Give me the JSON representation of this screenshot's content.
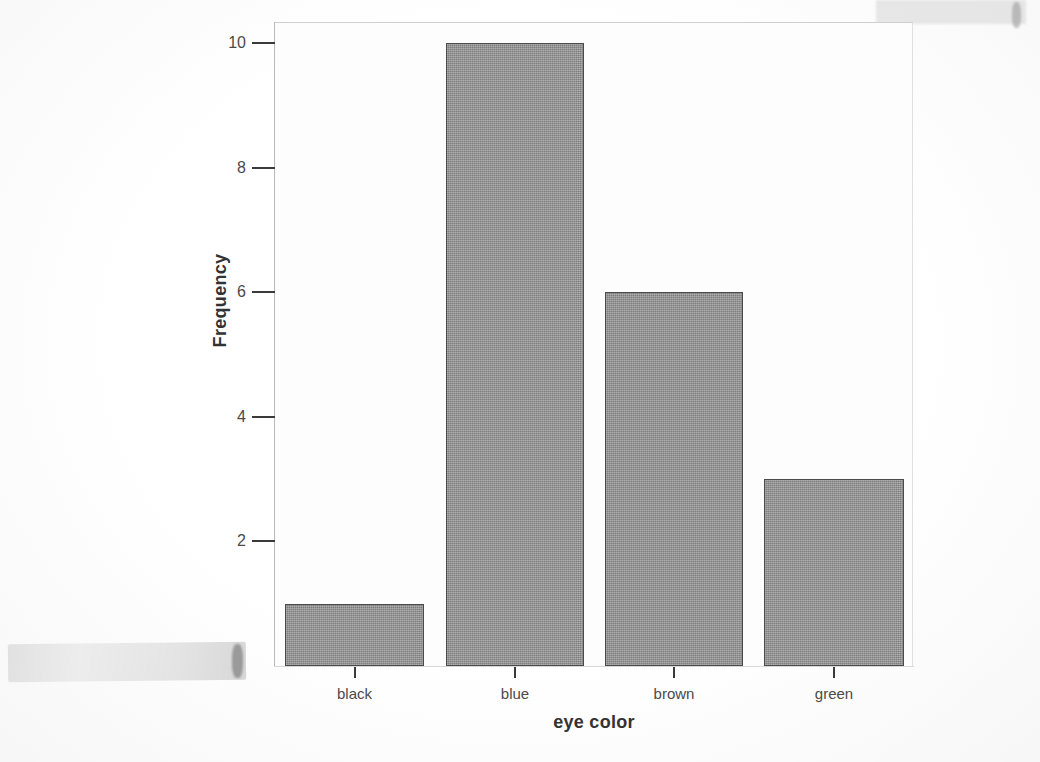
{
  "chart_data": {
    "type": "bar",
    "title": "",
    "subtitle": "",
    "xlabel": "eye color",
    "ylabel": "Frequency",
    "categories": [
      "black",
      "blue",
      "brown",
      "green"
    ],
    "values": [
      1,
      10,
      6,
      3
    ],
    "series": [
      {
        "name": "Frequency",
        "values": [
          1,
          10,
          6,
          3
        ]
      }
    ],
    "ylim": [
      0,
      10.4
    ],
    "y_ticks": [
      2,
      4,
      6,
      8,
      10
    ],
    "y_tick_labels": [
      "2",
      "4",
      "6",
      "8",
      "10"
    ],
    "x_tick_labels": [
      "black",
      "blue",
      "brown",
      "green"
    ],
    "grid": false,
    "legend": null,
    "legend_position": "none",
    "bar_fill_color": "#8e8e8e",
    "bar_edge_color": "#4a4a4a",
    "plot_background": "#fdfdfd",
    "axis_color": "#3a3a3a",
    "text_color": "#4a4a4a"
  },
  "figure": {
    "axis_title_x": "eye color",
    "axis_title_y": "Frequency"
  },
  "artifacts": {
    "description": "scanned page smudges"
  }
}
